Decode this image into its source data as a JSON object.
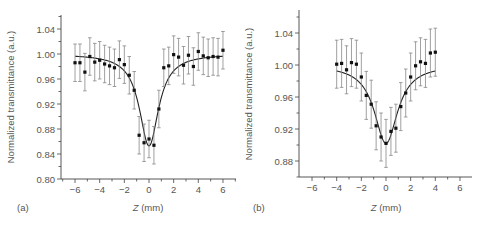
{
  "chart_data": [
    {
      "type": "scatter",
      "panel_label": "(a)",
      "xlabel_italic": "Z",
      "xlabel_unit": " (mm)",
      "xlabel": "Z (mm)",
      "ylabel": "Normalized transmittance (a.u.)",
      "xlim": [
        -6.9,
        7.0
      ],
      "ylim": [
        0.8,
        1.07
      ],
      "xticks": [
        -6,
        -4,
        -2,
        0,
        2,
        4,
        6
      ],
      "yticks": [
        0.8,
        0.84,
        0.88,
        0.92,
        0.96,
        1.0,
        1.04
      ],
      "ytick_labels": [
        "0.80",
        "0.84",
        "0.88",
        "0.92",
        "0.96",
        "1.00",
        "1.04"
      ],
      "grid": false,
      "series": [
        {
          "name": "measured",
          "style": "points-with-errorbars",
          "x": [
            -6.0,
            -5.6,
            -5.2,
            -4.8,
            -4.4,
            -4.0,
            -3.6,
            -3.2,
            -2.8,
            -2.4,
            -2.0,
            -1.6,
            -1.2,
            -0.8,
            -0.4,
            0.0,
            0.4,
            0.8,
            1.2,
            1.6,
            2.0,
            2.4,
            2.8,
            3.2,
            3.6,
            4.0,
            4.4,
            4.8,
            5.2,
            5.6,
            6.0
          ],
          "y": [
            0.986,
            0.986,
            0.971,
            0.996,
            0.987,
            0.99,
            0.984,
            0.981,
            0.978,
            0.991,
            0.983,
            0.966,
            0.942,
            0.87,
            0.858,
            0.864,
            0.854,
            0.912,
            0.978,
            0.981,
            0.999,
            0.995,
            0.982,
            0.998,
            0.98,
            1.004,
            0.997,
            0.994,
            0.996,
            0.995,
            1.006
          ],
          "yerr": 0.03
        },
        {
          "name": "fit",
          "style": "line",
          "model": "1 - A / (1 + (z/z0)^2)",
          "A": 0.147,
          "z0": 0.95
        }
      ]
    },
    {
      "type": "scatter",
      "panel_label": "(b)",
      "xlabel_italic": "Z",
      "xlabel_unit": " (mm)",
      "xlabel": "Z (mm)",
      "ylabel": "Normalized transmittance (a.u.)",
      "xlim": [
        -6.9,
        7.0
      ],
      "ylim": [
        0.861,
        1.07
      ],
      "xticks": [
        -6,
        -4,
        -2,
        0,
        2,
        4,
        6
      ],
      "yticks": [
        0.88,
        0.92,
        0.96,
        1.0,
        1.04
      ],
      "ytick_labels": [
        "0.88",
        "0.92",
        "0.96",
        "1.00",
        "1.04"
      ],
      "grid": false,
      "series": [
        {
          "name": "measured",
          "style": "points-with-errorbars",
          "x": [
            -4.0,
            -3.6,
            -3.2,
            -2.8,
            -2.4,
            -2.0,
            -1.6,
            -1.2,
            -0.8,
            -0.4,
            0.0,
            0.4,
            0.8,
            1.2,
            1.6,
            2.0,
            2.4,
            2.8,
            3.2,
            3.6,
            4.0
          ],
          "y": [
            1.001,
            1.002,
            0.994,
            1.003,
            1.001,
            0.985,
            0.962,
            0.951,
            0.924,
            0.91,
            0.902,
            0.917,
            0.921,
            0.948,
            0.965,
            0.985,
            0.999,
            1.004,
            1.002,
            1.015,
            1.016
          ],
          "yerr": 0.03
        },
        {
          "name": "fit",
          "style": "line",
          "model": "1 - A / (1 + (z/z0)^2)",
          "A": 0.098,
          "z0": 1.15
        }
      ]
    }
  ]
}
